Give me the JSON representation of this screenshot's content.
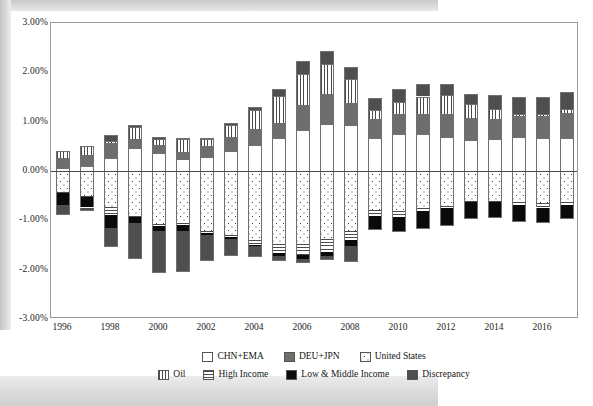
{
  "chart_data": {
    "type": "bar",
    "subtype": "stacked-bar-diverging",
    "title": "",
    "xlabel": "",
    "ylabel": "",
    "ylim": [
      -3.0,
      3.0
    ],
    "ytick_labels": [
      "3.00%",
      "2.00%",
      "1.00%",
      "0.00%",
      "-1.00%",
      "-2.00%",
      "-3.00%"
    ],
    "ytick_values": [
      3.0,
      2.0,
      1.0,
      0.0,
      -1.0,
      -2.0,
      -3.0
    ],
    "grid": false,
    "legend_position": "bottom",
    "unit": "percent",
    "categories": [
      1996,
      1997,
      1998,
      1999,
      2000,
      2001,
      2002,
      2003,
      2004,
      2005,
      2006,
      2007,
      2008,
      2009,
      2010,
      2011,
      2012,
      2013,
      2014,
      2015,
      2016,
      2017
    ],
    "xtick_labels": [
      "1996",
      "1998",
      "2000",
      "2002",
      "2004",
      "2006",
      "2008",
      "2010",
      "2012",
      "2014",
      "2016"
    ],
    "series": [
      {
        "name": "CHN+EMA",
        "fill": "white",
        "values": [
          0.06,
          0.1,
          0.26,
          0.46,
          0.37,
          0.24,
          0.28,
          0.4,
          0.52,
          0.66,
          0.83,
          0.96,
          0.94,
          0.66,
          0.74,
          0.75,
          0.68,
          0.63,
          0.65,
          0.68,
          0.66,
          0.67
        ]
      },
      {
        "name": "DEU+JPN",
        "fill": "solid-gray",
        "values": [
          0.2,
          0.23,
          0.3,
          0.19,
          0.16,
          0.14,
          0.22,
          0.28,
          0.34,
          0.32,
          0.5,
          0.61,
          0.44,
          0.4,
          0.41,
          0.4,
          0.48,
          0.44,
          0.4,
          0.43,
          0.46,
          0.5
        ]
      },
      {
        "name": "Oil",
        "fill": "vertical-stripes",
        "values": [
          0.14,
          0.18,
          0.05,
          0.24,
          0.12,
          0.27,
          0.14,
          0.25,
          0.38,
          0.55,
          0.64,
          0.6,
          0.48,
          0.18,
          0.25,
          0.36,
          0.38,
          0.29,
          0.2,
          0.04,
          0.03,
          0.09
        ]
      },
      {
        "name": "Discrepancy",
        "fill": "dark-gray",
        "values": [
          0.0,
          0.0,
          0.12,
          0.04,
          0.04,
          0.02,
          0.03,
          0.04,
          0.06,
          0.14,
          0.25,
          0.27,
          0.25,
          0.24,
          0.27,
          0.26,
          0.22,
          0.2,
          0.3,
          0.35,
          0.35,
          0.35
        ]
      },
      {
        "name": "United States",
        "fill": "dotted",
        "values": [
          -0.43,
          -0.5,
          -0.72,
          -0.91,
          -1.07,
          -1.05,
          -1.22,
          -1.3,
          -1.4,
          -1.48,
          -1.47,
          -1.38,
          -1.22,
          -0.8,
          -0.82,
          -0.74,
          -0.7,
          -0.6,
          -0.6,
          -0.63,
          -0.64,
          -0.62
        ]
      },
      {
        "name": "High Income",
        "fill": "horizontal-stripes",
        "values": [
          -0.02,
          -0.02,
          -0.18,
          -0.03,
          -0.04,
          -0.05,
          -0.03,
          -0.03,
          -0.09,
          -0.18,
          -0.23,
          -0.26,
          -0.18,
          -0.12,
          -0.11,
          -0.07,
          -0.04,
          -0.02,
          -0.02,
          -0.05,
          -0.1,
          -0.06
        ]
      },
      {
        "name": "Low & Middle Income",
        "fill": "black",
        "values": [
          -0.24,
          -0.22,
          -0.26,
          -0.12,
          -0.1,
          -0.12,
          -0.04,
          -0.04,
          -0.04,
          -0.07,
          -0.08,
          -0.08,
          -0.13,
          -0.25,
          -0.28,
          -0.35,
          -0.35,
          -0.33,
          -0.32,
          -0.34,
          -0.3,
          -0.28
        ]
      },
      {
        "name": "Discrepancy (neg)",
        "fill": "dark-gray",
        "values": [
          -0.18,
          -0.06,
          -0.36,
          -0.7,
          -0.84,
          -0.8,
          -0.52,
          -0.34,
          -0.2,
          -0.08,
          -0.06,
          -0.06,
          -0.3,
          0.0,
          0.0,
          0.0,
          0.0,
          0.0,
          0.0,
          0.0,
          0.0,
          0.0
        ]
      }
    ]
  },
  "legend": {
    "row1": [
      {
        "label": "CHN+EMA",
        "icon": "swatch-white",
        "fill_class": "f-chn"
      },
      {
        "label": "DEU+JPN",
        "icon": "swatch-gray",
        "fill_class": "f-deu"
      },
      {
        "label": "United States",
        "icon": "swatch-dotted",
        "fill_class": "f-usa"
      }
    ],
    "row2": [
      {
        "label": "Oil",
        "icon": "swatch-vertical-stripes",
        "fill_class": "f-oil"
      },
      {
        "label": "High Income",
        "icon": "swatch-horizontal-stripes",
        "fill_class": "f-high"
      },
      {
        "label": "Low & Middle Income",
        "icon": "swatch-black",
        "fill_class": "f-low"
      },
      {
        "label": "Discrepancy",
        "icon": "swatch-dark-gray",
        "fill_class": "f-disc"
      }
    ]
  },
  "colors": {
    "chn_ema": "#ffffff",
    "deu_jpn": "#6e6e6e",
    "united_states": "#ffffff",
    "oil": "#ffffff",
    "high_income": "#ffffff",
    "low_middle_income": "#0a0a0a",
    "discrepancy": "#4f4f4f",
    "axis": "#9a9a9a",
    "zero_line": "#4a4a4a",
    "text": "#1b1b1b"
  }
}
